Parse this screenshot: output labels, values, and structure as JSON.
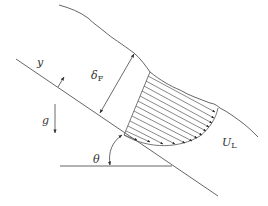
{
  "figure": {
    "labels": {
      "y_axis": "y",
      "film_thickness": "δ",
      "film_thickness_sub": "F",
      "gravity": "g",
      "angle": "θ",
      "velocity": "U",
      "velocity_sub": "L"
    },
    "colors": {
      "line": "#555555",
      "text": "#333333",
      "background": "#ffffff"
    },
    "velocity_profile_arrows": 13
  }
}
